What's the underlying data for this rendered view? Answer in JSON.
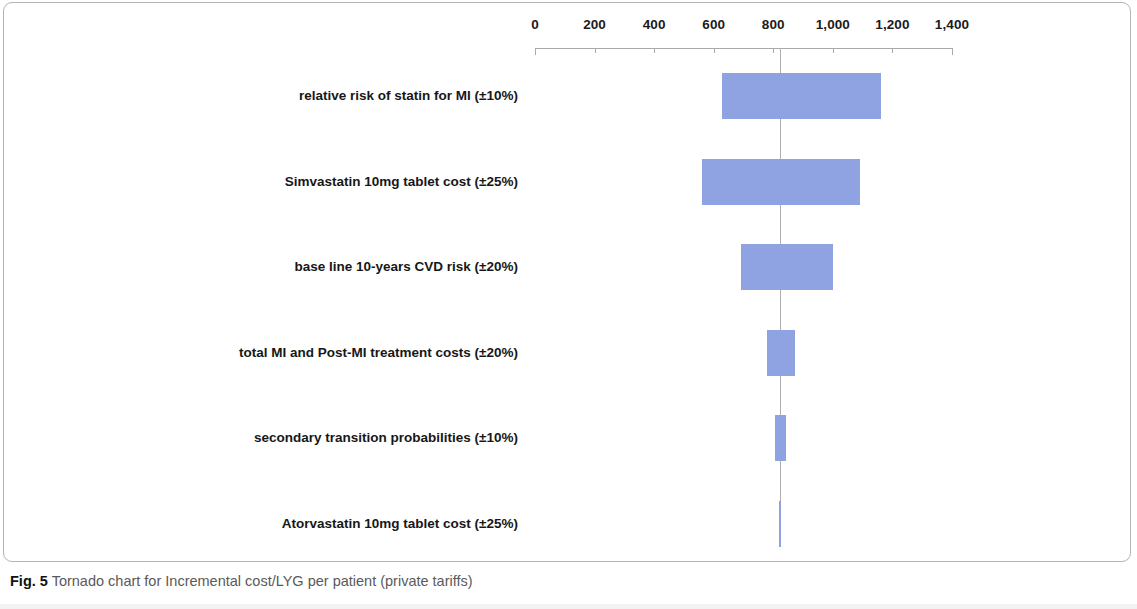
{
  "figure": {
    "caption_lead": "Fig. 5",
    "caption_text": " Tornado chart for Incremental cost/LYG per patient (private tariffs)"
  },
  "chart_data": {
    "type": "bar",
    "subtype": "tornado",
    "title": "Tornado chart for Incremental cost/LYG per patient (private tariffs)",
    "xlabel": "",
    "ylabel": "",
    "orientation": "horizontal",
    "grid": false,
    "legend": false,
    "xlim": [
      0,
      1400
    ],
    "xticks": [
      0,
      200,
      400,
      600,
      800,
      1000,
      1200,
      1400
    ],
    "xtick_labels": [
      "0",
      "200",
      "400",
      "600",
      "800",
      "1,000",
      "1,200",
      "1,400"
    ],
    "base_value": 822,
    "bar_color": "#8fa3e2",
    "axis_color": "#a9a9a9",
    "baseline_color": "#b0b0b0",
    "categories": [
      "relative risk of statin for MI (±10%)",
      "Simvastatin 10mg tablet cost (±25%)",
      "base line 10-years  CVD risk (±20%)",
      "total MI and Post-MI treatment costs (±20%)",
      "secondary transition probabilities (±10%)",
      "Atorvastatin 10mg tablet cost (±25%)"
    ],
    "bars": [
      {
        "label": "relative risk of statin for MI (±10%)",
        "low": 628,
        "high": 1162
      },
      {
        "label": "Simvastatin 10mg tablet cost (±25%)",
        "low": 561,
        "high": 1092
      },
      {
        "label": "base line 10-years  CVD risk (±20%)",
        "low": 692,
        "high": 1001
      },
      {
        "label": "total MI and Post-MI treatment costs (±20%)",
        "low": 779,
        "high": 873
      },
      {
        "label": "secondary transition probabilities (±10%)",
        "low": 806,
        "high": 843
      },
      {
        "label": "Atorvastatin 10mg tablet cost (±25%)",
        "low": 819,
        "high": 826
      }
    ]
  }
}
